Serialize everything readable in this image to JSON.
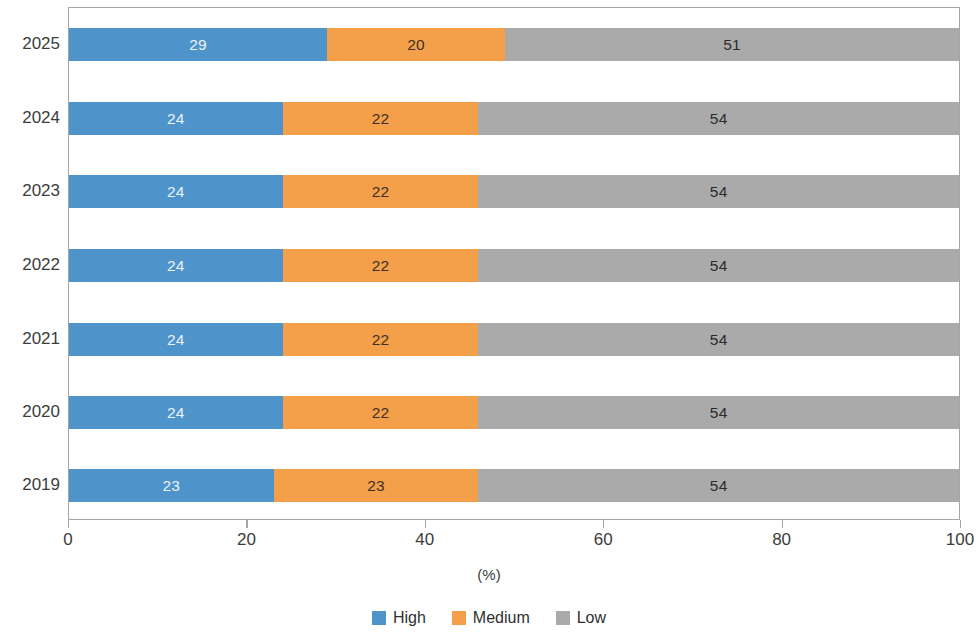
{
  "chart_data": {
    "type": "bar",
    "orientation": "horizontal",
    "stacked": true,
    "stack_mode": "percent",
    "title": "",
    "xlabel": "(%)",
    "ylabel": "",
    "xlim": [
      0,
      100
    ],
    "xticks": [
      "0",
      "20",
      "40",
      "60",
      "80",
      "100"
    ],
    "grid": false,
    "legend_position": "bottom",
    "categories": [
      "2025",
      "2024",
      "2023",
      "2022",
      "2021",
      "2020",
      "2019"
    ],
    "series": [
      {
        "name": "High",
        "color": "#4e93c9",
        "values": [
          29,
          24,
          24,
          24,
          24,
          24,
          23
        ]
      },
      {
        "name": "Medium",
        "color": "#f4a04b",
        "values": [
          20,
          22,
          22,
          22,
          22,
          22,
          23
        ]
      },
      {
        "name": "Low",
        "color": "#aaaaaa",
        "values": [
          51,
          54,
          54,
          54,
          54,
          54,
          54
        ]
      }
    ]
  },
  "axis": {
    "x_title": "(%)",
    "ticks": [
      {
        "label": "0",
        "value": 0
      },
      {
        "label": "20",
        "value": 20
      },
      {
        "label": "40",
        "value": 40
      },
      {
        "label": "60",
        "value": 60
      },
      {
        "label": "80",
        "value": 80
      },
      {
        "label": "100",
        "value": 100
      }
    ]
  },
  "legend": {
    "items": [
      {
        "label": "High",
        "color": "#4e93c9",
        "swatch_name": "legend-swatch-high"
      },
      {
        "label": "Medium",
        "color": "#f4a04b",
        "swatch_name": "legend-swatch-medium"
      },
      {
        "label": "Low",
        "color": "#aaaaaa",
        "swatch_name": "legend-swatch-low"
      }
    ]
  }
}
